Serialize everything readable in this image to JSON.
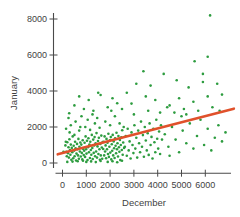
{
  "chart_data": {
    "type": "scatter",
    "title": "",
    "xlabel": "December",
    "ylabel": "January",
    "x_ticks": [
      0,
      1000,
      2000,
      3000,
      4000,
      5000,
      6000
    ],
    "y_ticks": [
      0,
      2000,
      4000,
      6000,
      8000
    ],
    "xlim": [
      -500,
      7300
    ],
    "ylim": [
      0,
      8400
    ],
    "grid": false,
    "legend": "none",
    "point_color": "#2d9c3f",
    "trend_color": "#e0512b",
    "axis_color": "#4a4a4a",
    "text_color": "#3f3f3f",
    "trend_line": {
      "x1": -200,
      "y1": 480,
      "x2": 7200,
      "y2": 3020
    },
    "points": [
      [
        120,
        980
      ],
      [
        160,
        620
      ],
      [
        180,
        380
      ],
      [
        200,
        1150
      ],
      [
        230,
        540
      ],
      [
        250,
        880
      ],
      [
        270,
        300
      ],
      [
        290,
        1320
      ],
      [
        310,
        720
      ],
      [
        330,
        460
      ],
      [
        350,
        1020
      ],
      [
        370,
        180
      ],
      [
        390,
        840
      ],
      [
        410,
        600
      ],
      [
        430,
        1480
      ],
      [
        450,
        260
      ],
      [
        470,
        960
      ],
      [
        490,
        690
      ],
      [
        510,
        380
      ],
      [
        530,
        1180
      ],
      [
        550,
        820
      ],
      [
        570,
        140
      ],
      [
        590,
        520
      ],
      [
        610,
        1060
      ],
      [
        630,
        760
      ],
      [
        650,
        420
      ],
      [
        670,
        1340
      ],
      [
        690,
        240
      ],
      [
        710,
        900
      ],
      [
        730,
        640
      ],
      [
        750,
        1140
      ],
      [
        770,
        360
      ],
      [
        790,
        1020
      ],
      [
        810,
        560
      ],
      [
        830,
        200
      ],
      [
        850,
        1260
      ],
      [
        870,
        780
      ],
      [
        890,
        440
      ],
      [
        200,
        60
      ],
      [
        420,
        80
      ],
      [
        640,
        100
      ],
      [
        860,
        120
      ],
      [
        300,
        1700
      ],
      [
        500,
        1560
      ],
      [
        700,
        1800
      ],
      [
        40,
        630
      ],
      [
        140,
        1180
      ],
      [
        150,
        1900
      ],
      [
        350,
        2100
      ],
      [
        550,
        2300
      ],
      [
        750,
        2000
      ],
      [
        250,
        2500
      ],
      [
        280,
        2760
      ],
      [
        910,
        680
      ],
      [
        930,
        1120
      ],
      [
        950,
        340
      ],
      [
        970,
        1480
      ],
      [
        990,
        760
      ],
      [
        1010,
        520
      ],
      [
        1030,
        1240
      ],
      [
        1050,
        160
      ],
      [
        1070,
        880
      ],
      [
        1090,
        1380
      ],
      [
        1110,
        600
      ],
      [
        1130,
        1020
      ],
      [
        1150,
        280
      ],
      [
        1170,
        1180
      ],
      [
        1190,
        720
      ],
      [
        1210,
        460
      ],
      [
        1230,
        1560
      ],
      [
        1250,
        840
      ],
      [
        1270,
        220
      ],
      [
        1290,
        1300
      ],
      [
        1310,
        560
      ],
      [
        1330,
        980
      ],
      [
        1350,
        1440
      ],
      [
        1370,
        380
      ],
      [
        1390,
        1100
      ],
      [
        1410,
        640
      ],
      [
        1430,
        1660
      ],
      [
        1450,
        300
      ],
      [
        1470,
        920
      ],
      [
        1490,
        1220
      ],
      [
        1510,
        500
      ],
      [
        1530,
        1400
      ],
      [
        1550,
        760
      ],
      [
        1570,
        180
      ],
      [
        1590,
        1060
      ],
      [
        1610,
        420
      ],
      [
        1630,
        1520
      ],
      [
        1650,
        860
      ],
      [
        1670,
        240
      ],
      [
        1690,
        1160
      ],
      [
        960,
        2000
      ],
      [
        1160,
        1840
      ],
      [
        1360,
        2200
      ],
      [
        1560,
        1960
      ],
      [
        1060,
        2400
      ],
      [
        1260,
        2700
      ],
      [
        1460,
        2500
      ],
      [
        1000,
        60
      ],
      [
        1200,
        90
      ],
      [
        1400,
        50
      ],
      [
        1600,
        110
      ],
      [
        1710,
        780
      ],
      [
        1730,
        1180
      ],
      [
        1750,
        420
      ],
      [
        1770,
        1480
      ],
      [
        1790,
        640
      ],
      [
        1810,
        980
      ],
      [
        1830,
        260
      ],
      [
        1850,
        1340
      ],
      [
        1870,
        760
      ],
      [
        1890,
        1120
      ],
      [
        1910,
        500
      ],
      [
        1930,
        1620
      ],
      [
        1950,
        340
      ],
      [
        1970,
        900
      ],
      [
        1990,
        1260
      ],
      [
        2010,
        580
      ],
      [
        2030,
        1440
      ],
      [
        2050,
        200
      ],
      [
        2070,
        1040
      ],
      [
        2090,
        680
      ],
      [
        2110,
        1560
      ],
      [
        2130,
        420
      ],
      [
        2150,
        1200
      ],
      [
        2170,
        820
      ],
      [
        2190,
        280
      ],
      [
        2210,
        1380
      ],
      [
        2230,
        960
      ],
      [
        2250,
        540
      ],
      [
        2270,
        1680
      ],
      [
        2290,
        760
      ],
      [
        2310,
        1100
      ],
      [
        2330,
        360
      ],
      [
        2350,
        1500
      ],
      [
        2370,
        880
      ],
      [
        2390,
        620
      ],
      [
        2410,
        1280
      ],
      [
        2430,
        160
      ],
      [
        2450,
        1000
      ],
      [
        2470,
        1420
      ],
      [
        2490,
        720
      ],
      [
        2510,
        1820
      ],
      [
        2530,
        460
      ],
      [
        2550,
        1140
      ],
      [
        2570,
        2000
      ],
      [
        2590,
        840
      ],
      [
        1800,
        2300
      ],
      [
        2000,
        2100
      ],
      [
        2200,
        2600
      ],
      [
        2400,
        2200
      ],
      [
        1900,
        60
      ],
      [
        2100,
        100
      ],
      [
        2300,
        40
      ],
      [
        2500,
        130
      ],
      [
        700,
        3700
      ],
      [
        1100,
        3500
      ],
      [
        1600,
        3780
      ],
      [
        2300,
        3320
      ],
      [
        900,
        3000
      ],
      [
        1300,
        2900
      ],
      [
        1900,
        3100
      ],
      [
        2100,
        3600
      ],
      [
        500,
        3200
      ],
      [
        1500,
        3900
      ],
      [
        2500,
        3000
      ],
      [
        800,
        2600
      ],
      [
        2050,
        2900
      ],
      [
        2620,
        900
      ],
      [
        2660,
        1500
      ],
      [
        2700,
        400
      ],
      [
        2740,
        1900
      ],
      [
        2780,
        700
      ],
      [
        2820,
        1200
      ],
      [
        2860,
        250
      ],
      [
        2900,
        1700
      ],
      [
        2940,
        1000
      ],
      [
        2980,
        550
      ],
      [
        3020,
        2100
      ],
      [
        3060,
        800
      ],
      [
        3100,
        1400
      ],
      [
        3140,
        300
      ],
      [
        3180,
        1800
      ],
      [
        3220,
        1100
      ],
      [
        3260,
        600
      ],
      [
        3300,
        2300
      ],
      [
        3340,
        900
      ],
      [
        3380,
        1550
      ],
      [
        3420,
        350
      ],
      [
        3460,
        2000
      ],
      [
        3500,
        1250
      ],
      [
        3540,
        700
      ],
      [
        3580,
        1650
      ],
      [
        3620,
        450
      ],
      [
        3660,
        2200
      ],
      [
        3700,
        1000
      ],
      [
        3740,
        1450
      ],
      [
        3780,
        250
      ],
      [
        3820,
        1900
      ],
      [
        3860,
        1150
      ],
      [
        3900,
        600
      ],
      [
        3940,
        2400
      ],
      [
        3980,
        1350
      ],
      [
        4020,
        800
      ],
      [
        4060,
        1750
      ],
      [
        4100,
        500
      ],
      [
        4140,
        2100
      ],
      [
        4180,
        1300
      ],
      [
        2700,
        3900
      ],
      [
        2900,
        3300
      ],
      [
        3100,
        4400
      ],
      [
        3400,
        5100
      ],
      [
        3500,
        3700
      ],
      [
        3600,
        2900
      ],
      [
        3700,
        4300
      ],
      [
        3900,
        3500
      ],
      [
        4100,
        2800
      ],
      [
        4250,
        4950
      ],
      [
        4400,
        3100
      ],
      [
        3000,
        2700
      ],
      [
        4300,
        1600
      ],
      [
        4450,
        900
      ],
      [
        4600,
        2000
      ],
      [
        4750,
        1300
      ],
      [
        4900,
        600
      ],
      [
        5050,
        1800
      ],
      [
        5200,
        1100
      ],
      [
        5350,
        2200
      ],
      [
        5500,
        800
      ],
      [
        5650,
        1500
      ],
      [
        5800,
        2400
      ],
      [
        5950,
        1000
      ],
      [
        6100,
        1900
      ],
      [
        6250,
        700
      ],
      [
        6400,
        1400
      ],
      [
        6550,
        2100
      ],
      [
        6700,
        1200
      ],
      [
        6850,
        1700
      ],
      [
        4500,
        400
      ],
      [
        5000,
        2600
      ],
      [
        4500,
        3200
      ],
      [
        4700,
        2800
      ],
      [
        4900,
        3600
      ],
      [
        5100,
        3000
      ],
      [
        5300,
        4200
      ],
      [
        5500,
        3400
      ],
      [
        5700,
        2900
      ],
      [
        5900,
        4500
      ],
      [
        6100,
        3700
      ],
      [
        6300,
        3100
      ],
      [
        6500,
        4400
      ],
      [
        6700,
        3800
      ],
      [
        4800,
        4600
      ],
      [
        5200,
        2700
      ],
      [
        6600,
        2900
      ],
      [
        6200,
        8200
      ],
      [
        6100,
        5900
      ],
      [
        5550,
        5650
      ],
      [
        5900,
        4950
      ]
    ]
  }
}
